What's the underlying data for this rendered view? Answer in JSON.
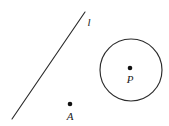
{
  "figure": {
    "background_color": "#ffffff",
    "stroke_color": "#2b2b2b",
    "label_color": "#1a1a1a",
    "width": 169,
    "height": 126
  },
  "line": {
    "label": "l",
    "label_x": 89,
    "label_y": 26,
    "x1": 12,
    "y1": 119,
    "x2": 85,
    "y2": 12
  },
  "point_a": {
    "label": "A",
    "dot_x": 70,
    "dot_y": 104,
    "dot_r": 2.3,
    "label_x": 70,
    "label_y": 120
  },
  "circle": {
    "center_x": 131,
    "center_y": 70,
    "radius": 31
  },
  "point_p": {
    "label": "P",
    "dot_x": 130,
    "dot_y": 68,
    "dot_r": 2.3,
    "label_x": 130,
    "label_y": 83
  },
  "chart_data": {
    "type": "diagram",
    "elements": [
      {
        "kind": "line",
        "label": "l",
        "from": [
          12,
          119
        ],
        "to": [
          85,
          12
        ]
      },
      {
        "kind": "point",
        "label": "A",
        "at": [
          70,
          104
        ]
      },
      {
        "kind": "circle",
        "center": [
          131,
          70
        ],
        "radius": 31
      },
      {
        "kind": "point",
        "label": "P",
        "at": [
          130,
          68
        ],
        "note": "center of circle"
      }
    ]
  }
}
